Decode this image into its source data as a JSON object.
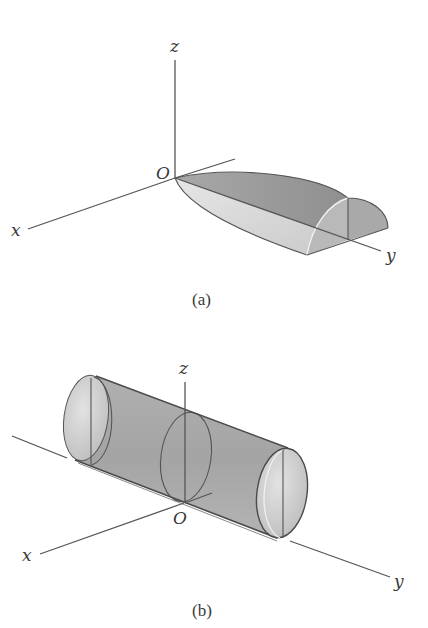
{
  "figure": {
    "panels": [
      {
        "id": "a",
        "caption": "(a)",
        "description": "Solid region in first octant bounded by a parabolic-cylinder-like surface, tapering to the origin and ending in a quarter-circular cross-section along the y-axis",
        "axes": {
          "x": "x",
          "y": "y",
          "z": "z",
          "origin": "O"
        }
      },
      {
        "id": "b",
        "caption": "(b)",
        "description": "Circular cylinder lying along the y-axis, centered on the x-y plane with elliptical cross-section outlines",
        "axes": {
          "x": "x",
          "y": "y",
          "z": "z",
          "origin": "O"
        }
      }
    ]
  },
  "colors": {
    "axis": "#555555",
    "surface_dark": "#9a9a9a",
    "surface_mid": "#b5b5b5",
    "surface_light": "#dcdcdc",
    "background": "#ffffff"
  }
}
